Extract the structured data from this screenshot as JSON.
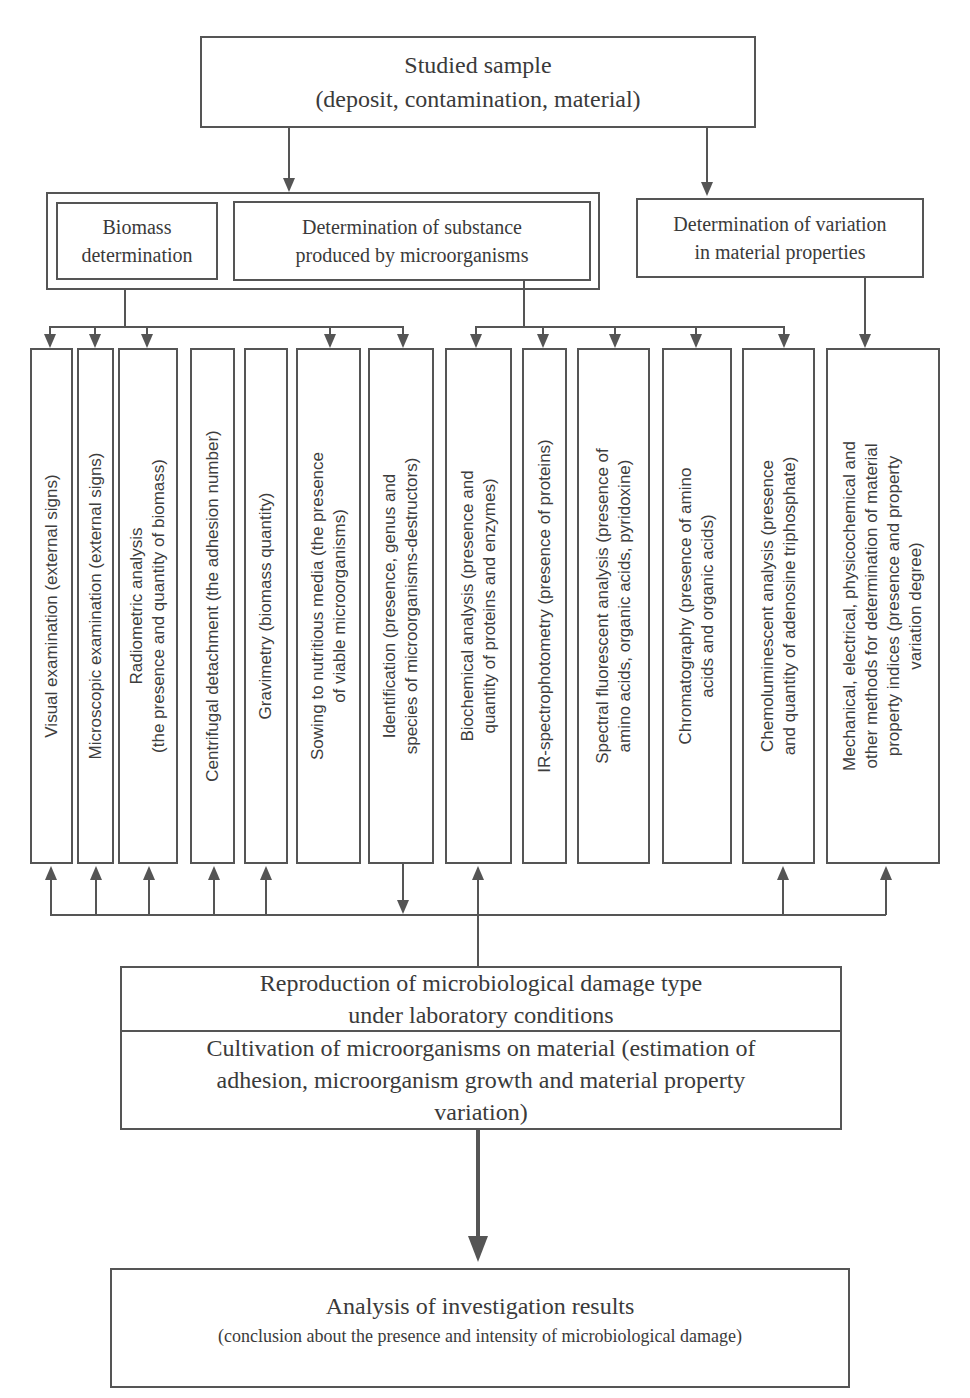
{
  "top_box": {
    "title": "Studied sample",
    "subtitle": "(deposit, contamination, material)"
  },
  "group_left": {
    "biomass": "Biomass\ndetermination",
    "substance": "Determination of substance\nproduced by microorganisms"
  },
  "variation_box": "Determination of variation\nin material properties",
  "methods": [
    {
      "label": "Visual examination (external signs)"
    },
    {
      "label": "Microscopic examination (external signs)"
    },
    {
      "label": "Radiometric analysis\n(the presence and quantity of biomass)"
    },
    {
      "label": "Centrifugal detachment (the adhesion number)"
    },
    {
      "label": "Gravimetry (biomass quantity)"
    },
    {
      "label": "Sowing to nutritious media (the presence\nof viable microorganisms)"
    },
    {
      "label": "Identification (presence, genus and\nspecies of microorganisms-destructors)"
    },
    {
      "label": "Biochemical analysis (presence and\nquantity of proteins and enzymes)"
    },
    {
      "label": "IR-spectrophotometry (presence of proteins)"
    },
    {
      "label": "Spectral fluorescent analysis (presence of\namino acids, organic acids, pyridoxine)"
    },
    {
      "label": "Chromatography (presence of amino\nacids and organic acids)"
    },
    {
      "label": "Chemoluminescent analysis (presence\nand quantity of adenosine triphosphate)"
    },
    {
      "label": "Mechanical, electrical, physicochemical and\nother methods for determination of  material\nproperty indices (presence and property\nvariation degree)"
    }
  ],
  "reproduction_box": {
    "top": "Reproduction of microbiological damage type\nunder laboratory conditions",
    "bottom": "Cultivation of microorganisms on material (estimation of\nadhesion, microorganism growth and material property\nvariation)"
  },
  "result_box": {
    "title": "Analysis of investigation results",
    "subtitle": "(conclusion about the presence and intensity of microbiological damage)"
  }
}
